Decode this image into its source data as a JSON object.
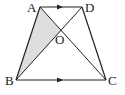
{
  "diagram": {
    "type": "trapezoid-with-diagonals",
    "colors": {
      "stroke": "#222222",
      "shade": "#dedede",
      "background": "#ffffff"
    },
    "vertices": {
      "A": {
        "label": "A",
        "x": 40,
        "y": 7
      },
      "D": {
        "label": "D",
        "x": 82,
        "y": 7
      },
      "B": {
        "label": "B",
        "x": 16,
        "y": 80
      },
      "C": {
        "label": "C",
        "x": 106,
        "y": 80
      },
      "O": {
        "label": "O",
        "x": 61,
        "y": 31
      }
    },
    "shaded_region": [
      "A",
      "B",
      "O"
    ],
    "parallel_sides": [
      "AD",
      "BC"
    ]
  }
}
